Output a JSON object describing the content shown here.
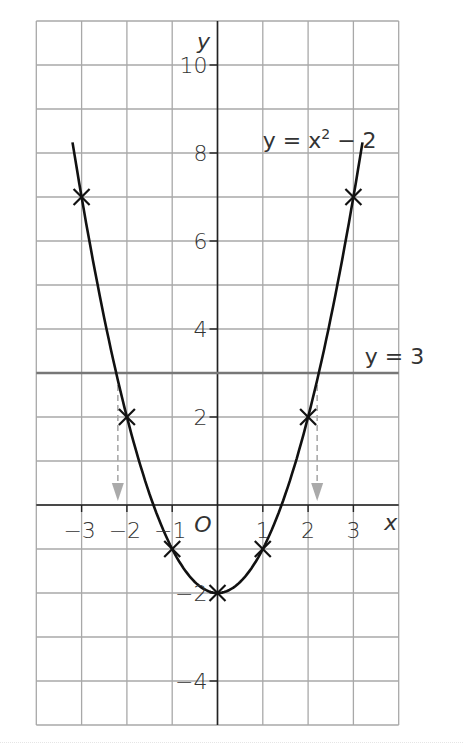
{
  "chart_data": {
    "type": "line",
    "title": "",
    "xlabel": "x",
    "ylabel": "y",
    "xlim": [
      -3,
      4
    ],
    "ylim": [
      -5,
      11
    ],
    "grid": true,
    "x_ticks": [
      "-3",
      "-2",
      "-1",
      "1",
      "2",
      "3"
    ],
    "y_ticks": [
      "10",
      "8",
      "6",
      "4",
      "2",
      "-2",
      "-4"
    ],
    "origin_label": "O",
    "series": [
      {
        "name": "y = x² − 2",
        "label_text": "y = x",
        "label_sup": "2",
        "label_tail": " − 2",
        "type": "curve",
        "x": [
          -3,
          -2,
          -1,
          0,
          1,
          2,
          3
        ],
        "y": [
          7,
          2,
          -1,
          -2,
          -1,
          2,
          7
        ],
        "marker": "x",
        "color": "#111111"
      },
      {
        "name": "y = 3",
        "label_text": "y = 3",
        "type": "hline",
        "y": 3,
        "color": "#777777"
      }
    ],
    "annotations": [
      {
        "type": "dashed-arrow",
        "from": [
          -2.2,
          3
        ],
        "to": [
          -2.2,
          0
        ],
        "color": "#aaaaaa"
      },
      {
        "type": "dashed-arrow",
        "from": [
          2.2,
          3
        ],
        "to": [
          2.2,
          0
        ],
        "color": "#aaaaaa"
      }
    ]
  }
}
